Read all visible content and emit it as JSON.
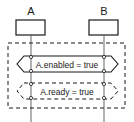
{
  "diagram": {
    "type": "sequence-condition",
    "colors": {
      "stroke": "#1a1a1a",
      "background": "#ffffff"
    },
    "instances": [
      {
        "id": "A",
        "label": "A"
      },
      {
        "id": "B",
        "label": "B"
      }
    ],
    "frame": {
      "style": "dashed"
    },
    "conditions": [
      {
        "label": "A.enabled = true",
        "style": "solid",
        "spans": [
          "A",
          "B"
        ]
      },
      {
        "label": "A.ready = true",
        "style": "dashed",
        "spans": [
          "A",
          "B"
        ]
      }
    ]
  }
}
